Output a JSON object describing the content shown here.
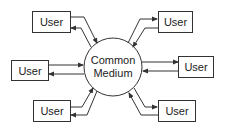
{
  "diagram": {
    "center": {
      "label_line1": "Common",
      "label_line2": "Medium"
    },
    "users": [
      {
        "id": "top-left",
        "label": "User"
      },
      {
        "id": "top-right",
        "label": "User"
      },
      {
        "id": "mid-left",
        "label": "User"
      },
      {
        "id": "mid-right",
        "label": "User"
      },
      {
        "id": "bottom-left",
        "label": "User"
      },
      {
        "id": "bottom-right",
        "label": "User"
      }
    ],
    "colors": {
      "stroke": "#333333",
      "background": "#ffffff",
      "text": "#222222"
    }
  }
}
